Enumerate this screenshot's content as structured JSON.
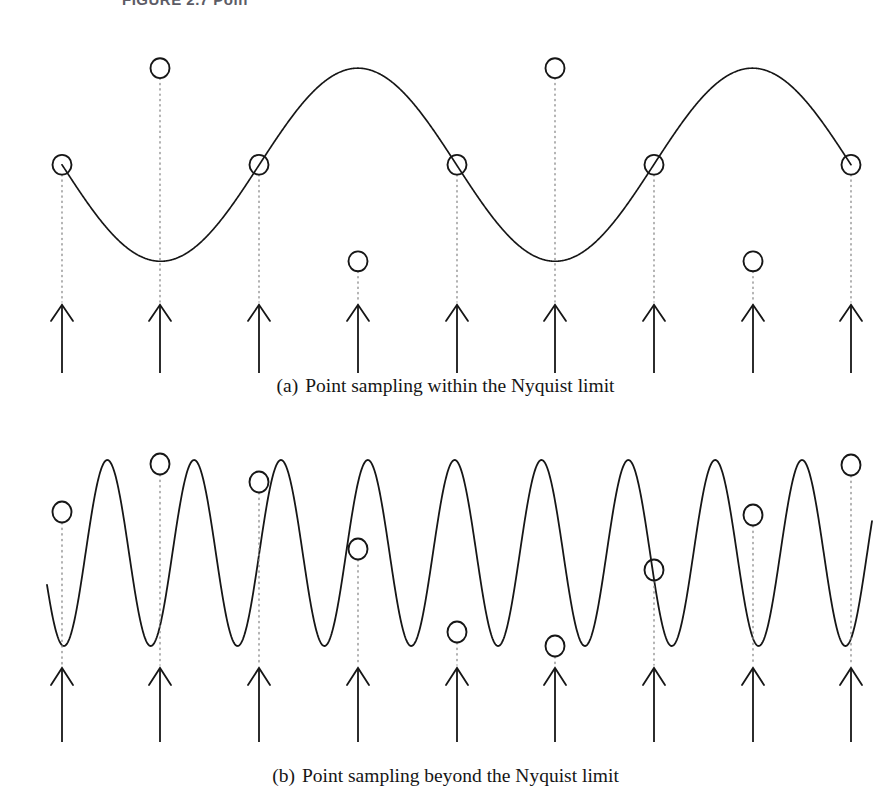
{
  "page": {
    "width": 891,
    "height": 808,
    "background": "#ffffff",
    "ink_color": "#161616",
    "dotted_color": "#8a8a8a",
    "clipped_header_text": "FIGURE 2.7  Poin"
  },
  "panels": [
    {
      "id": "a",
      "caption_tag": "(a)",
      "caption_text": "Point sampling within the Nyquist limit",
      "wave": {
        "cycles": 2,
        "phase_deg": 180,
        "baseline_y": 155,
        "amplitude": 102,
        "peak_y": 53,
        "trough_y": 257,
        "x_start": 62,
        "x_end": 851,
        "stroke_width": 1.7
      },
      "samples": {
        "count": 9,
        "x_positions": [
          62,
          160,
          259,
          358,
          457,
          555,
          654,
          753,
          851
        ],
        "y_positions": [
          155,
          53,
          155,
          257,
          155,
          53,
          155,
          257,
          155
        ],
        "marker": "open-circle",
        "marker_rx": 9.5,
        "marker_ry": 10.5,
        "dotted_drop_to_y": 300
      },
      "arrows": {
        "count": 9,
        "x_positions": [
          62,
          160,
          259,
          358,
          457,
          555,
          654,
          753,
          851
        ],
        "tip_y": 303,
        "tail_y": 375,
        "head_half_width": 11,
        "head_height": 17
      }
    },
    {
      "id": "b",
      "caption_tag": "(b)",
      "caption_text": "Point sampling beyond the Nyquist limit",
      "wave": {
        "cycles": 9.5,
        "phase_deg": 200,
        "baseline_y": 133,
        "amplitude": 93,
        "peak_y": 40,
        "trough_y": 226,
        "x_start": 47,
        "x_end": 872,
        "stroke_width": 1.8
      },
      "samples": {
        "count": 9,
        "x_positions": [
          62,
          160,
          259,
          358,
          457,
          555,
          654,
          753,
          851
        ],
        "y_positions": [
          92,
          44,
          62,
          129,
          212,
          226,
          150,
          95,
          45
        ],
        "marker": "open-circle",
        "marker_rx": 9.5,
        "marker_ry": 10.5,
        "dotted_drop_to_y": 245
      },
      "arrows": {
        "count": 9,
        "x_positions": [
          62,
          160,
          259,
          358,
          457,
          555,
          654,
          753,
          851
        ],
        "tip_y": 248,
        "tail_y": 322,
        "head_half_width": 11,
        "head_height": 17
      }
    }
  ]
}
